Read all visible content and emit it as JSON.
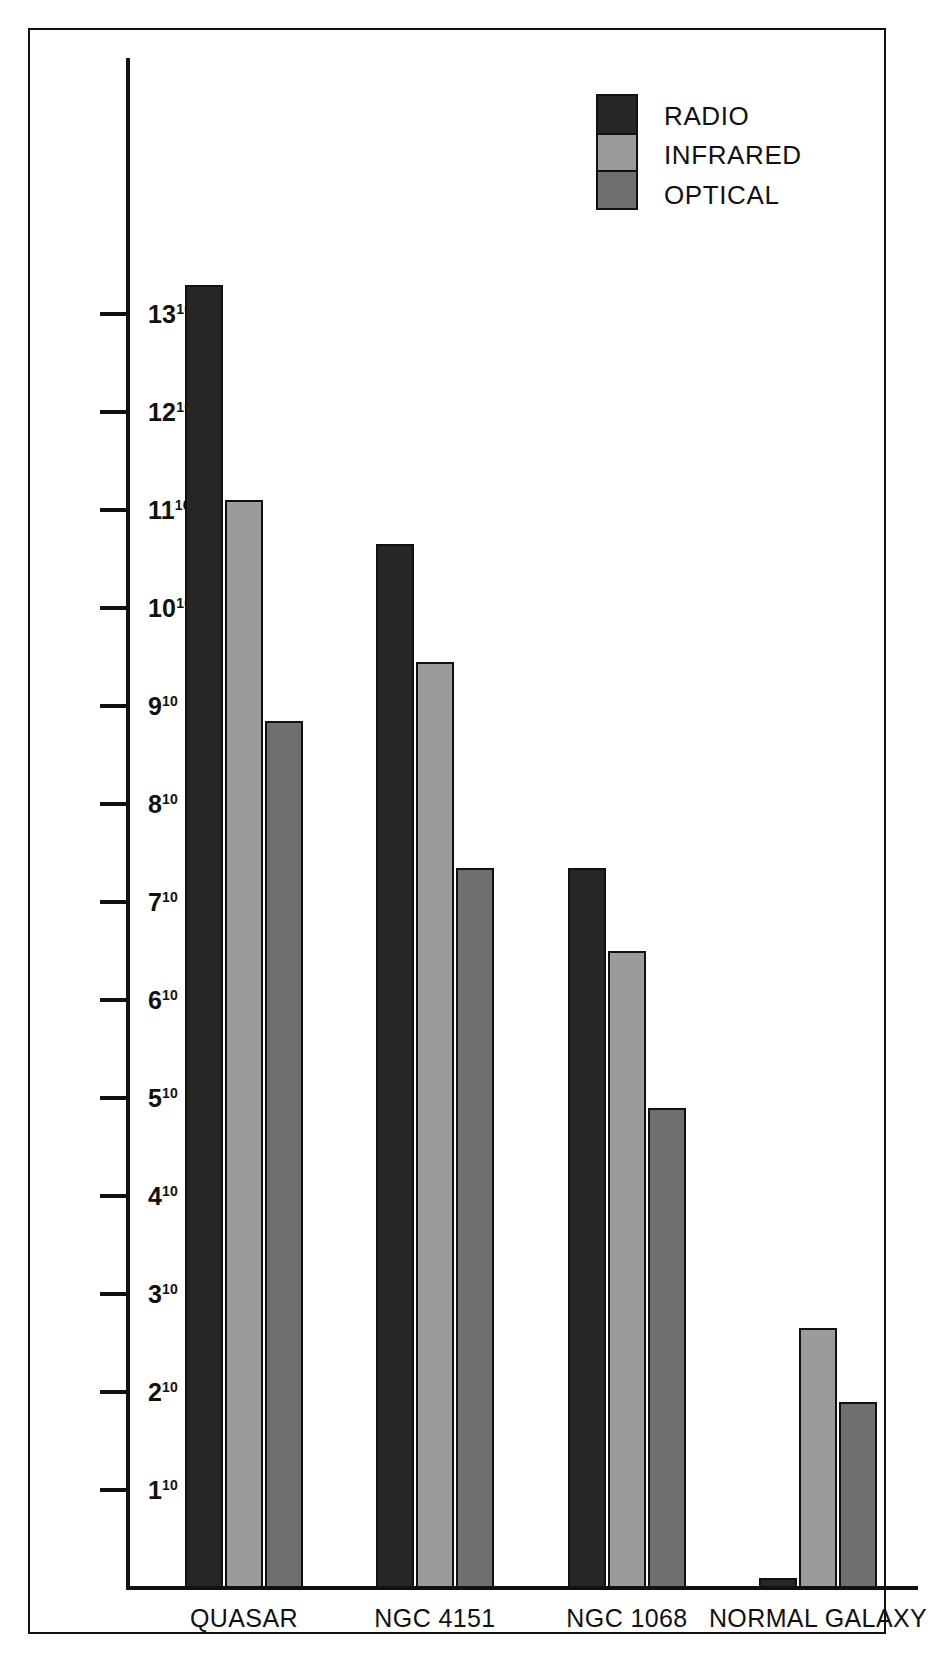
{
  "chart_data": {
    "type": "bar",
    "title": "",
    "subtitle": "",
    "xlabel": "",
    "ylabel": "",
    "categories": [
      "QUASAR",
      "NGC 4151",
      "NGC 1068",
      "NORMAL GALAXY"
    ],
    "series": [
      {
        "name": "RADIO",
        "color": "#262626",
        "values": [
          13.3,
          10.65,
          7.35,
          0.1
        ]
      },
      {
        "name": "INFRARED",
        "color": "#9b9b9b",
        "values": [
          11.1,
          9.45,
          6.5,
          2.65
        ]
      },
      {
        "name": "OPTICAL",
        "color": "#6f6f6f",
        "values": [
          8.85,
          7.35,
          4.9,
          1.9
        ]
      }
    ],
    "ylim": [
      0,
      13.9
    ],
    "y_tick_values": [
      1,
      2,
      3,
      4,
      5,
      6,
      7,
      8,
      9,
      10,
      11,
      12,
      13
    ],
    "y_tick_labels": [
      {
        "mantissa": "1",
        "exponent": "10"
      },
      {
        "mantissa": "2",
        "exponent": "10"
      },
      {
        "mantissa": "3",
        "exponent": "10"
      },
      {
        "mantissa": "4",
        "exponent": "10"
      },
      {
        "mantissa": "5",
        "exponent": "10"
      },
      {
        "mantissa": "6",
        "exponent": "10"
      },
      {
        "mantissa": "7",
        "exponent": "10"
      },
      {
        "mantissa": "8",
        "exponent": "10"
      },
      {
        "mantissa": "9",
        "exponent": "10"
      },
      {
        "mantissa": "10",
        "exponent": "10"
      },
      {
        "mantissa": "11",
        "exponent": "10"
      },
      {
        "mantissa": "12",
        "exponent": "10"
      },
      {
        "mantissa": "13",
        "exponent": "10"
      }
    ],
    "grid": false,
    "legend_position": "top-right"
  },
  "legend": {
    "entries": [
      {
        "label": "RADIO",
        "color": "#262626"
      },
      {
        "label": "INFRARED",
        "color": "#9b9b9b"
      },
      {
        "label": "OPTICAL",
        "color": "#6f6f6f"
      }
    ]
  },
  "axes": {
    "x_categories": [
      "QUASAR",
      "NGC 4151",
      "NGC 1068",
      "NORMAL GALAXY"
    ]
  },
  "colors": {
    "radio": "#262626",
    "infrared": "#9b9b9b",
    "optical": "#6f6f6f",
    "ink": "#111111",
    "paper": "#ffffff"
  }
}
